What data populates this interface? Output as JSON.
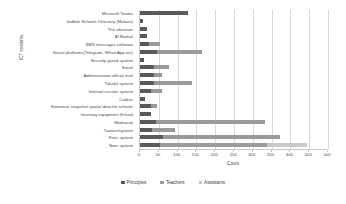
{
  "chart_data": {
    "type": "bar",
    "subtype": "stacked-horizontal",
    "title": "",
    "xlabel": "Count",
    "ylabel": "ICT systems",
    "xlim": [
      0,
      500
    ],
    "xticks": [
      0,
      50,
      100,
      150,
      200,
      250,
      300,
      350,
      400,
      450,
      500
    ],
    "grid": true,
    "legend_position": "bottom",
    "categories": [
      "Microsoft Teams",
      "Jeddah Schools Directory (Makani)",
      "The observer",
      "Al Marhal",
      "SMS messages software",
      "Social platforms(Telegram, WhatsApp etc)",
      "Security guard system",
      "Email",
      "Administration official mail",
      "Takaful system",
      "Internal circular system",
      "Cadres",
      "Statistical snapshot spatial data for schools",
      "Gateway equipment School",
      "Madrasati",
      "Tawasulsystem",
      "Faris system",
      "Noor system"
    ],
    "series": [
      {
        "name": "Principles",
        "color": "#5a5a5a",
        "values": [
          128,
          9,
          18,
          18,
          25,
          45,
          10,
          38,
          38,
          38,
          30,
          12,
          28,
          28,
          42,
          32,
          60,
          52
        ]
      },
      {
        "name": "Teachers",
        "color": "#9a9a9a",
        "values": [
          0,
          0,
          0,
          0,
          28,
          120,
          0,
          38,
          20,
          100,
          28,
          0,
          16,
          0,
          290,
          62,
          312,
          285
        ]
      },
      {
        "name": "Assistants",
        "color": "#c9c9c9",
        "values": [
          0,
          0,
          0,
          0,
          0,
          0,
          0,
          0,
          0,
          0,
          0,
          0,
          0,
          0,
          0,
          0,
          0,
          108
        ]
      }
    ]
  },
  "legend": {
    "items": [
      {
        "label": "Principles"
      },
      {
        "label": "Teachers"
      },
      {
        "label": "Assistants"
      }
    ]
  }
}
